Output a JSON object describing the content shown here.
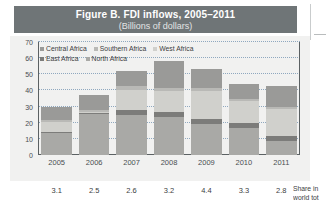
{
  "figure": {
    "title": "Figure B. FDI inflows, 2005–2011",
    "subtitle": "(Billions of dollars)"
  },
  "colors": {
    "title_band": "#6f7577",
    "panel_background": "#f1f1f0",
    "axis": "#5b6163",
    "gridline": "#8fa8bf",
    "central_africa": "#9a9a98",
    "southern_africa": "#b9b9b6",
    "west_africa": "#d0d0cc",
    "east_africa": "#7c7c7a",
    "north_africa": "#a9a9a6"
  },
  "legend": {
    "position": "top-left-inside",
    "rows": [
      [
        {
          "label": "Central Africa",
          "color": "#9a9a98"
        },
        {
          "label": "Southern Africa",
          "color": "#b9b9b6"
        },
        {
          "label": "West Africa",
          "color": "#d0d0cc"
        }
      ],
      [
        {
          "label": "East Africa",
          "color": "#7c7c7a"
        },
        {
          "label": "North Africa",
          "color": "#a9a9a6"
        }
      ]
    ]
  },
  "share_row": {
    "caption_line1": "Share in",
    "caption_line2": "world tot",
    "values": [
      "3.1",
      "2.5",
      "2.6",
      "3.2",
      "4.4",
      "3.3",
      "2.8"
    ]
  },
  "chart_data": {
    "type": "bar",
    "stacked": true,
    "title": "Figure B. FDI inflows, 2005–2011",
    "subtitle": "(Billions of dollars)",
    "xlabel": "",
    "ylabel": "",
    "ylim": [
      0,
      70
    ],
    "yticks": [
      0,
      10,
      20,
      30,
      40,
      50,
      60,
      70
    ],
    "grid": true,
    "legend_position": "upper left",
    "categories": [
      "2005",
      "2006",
      "2007",
      "2008",
      "2009",
      "2010",
      "2011"
    ],
    "series": [
      {
        "name": "North Africa",
        "color": "#a9a9a6",
        "values": [
          13.4,
          25.2,
          24.8,
          23.7,
          19.5,
          16.8,
          8.9
        ]
      },
      {
        "name": "East Africa",
        "color": "#7c7c7a",
        "values": [
          1.0,
          0.7,
          3.0,
          3.2,
          2.8,
          2.8,
          3.0
        ]
      },
      {
        "name": "West Africa",
        "color": "#d0d0cc",
        "values": [
          5.8,
          0.9,
          12.3,
          12.6,
          17.6,
          13.8,
          16.6
        ]
      },
      {
        "name": "Southern Africa",
        "color": "#b9b9b6",
        "values": [
          1.3,
          1.3,
          2.4,
          2.2,
          1.5,
          1.1,
          1.1
        ]
      },
      {
        "name": "Central Africa",
        "color": "#9a9a98",
        "values": [
          8.5,
          8.9,
          9.6,
          16.4,
          12.1,
          9.3,
          13.3
        ]
      }
    ],
    "totals": [
      30.0,
      37.0,
      52.1,
      58.1,
      53.5,
      43.8,
      42.9
    ],
    "share_in_world_total": [
      3.1,
      2.5,
      2.6,
      3.2,
      4.4,
      3.3,
      2.8
    ]
  }
}
